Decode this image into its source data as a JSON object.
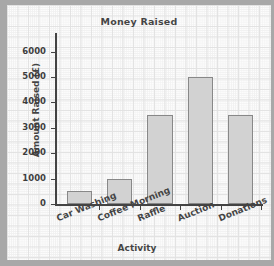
{
  "chart_data": {
    "type": "bar",
    "title": "Money Raised",
    "xlabel": "Activity",
    "ylabel": "Amount Raised (£)",
    "categories": [
      "Car Washing",
      "Coffee Morning",
      "Raffle",
      "Auction",
      "Donations"
    ],
    "values": [
      500,
      1000,
      3500,
      5000,
      3500
    ],
    "ylim": [
      0,
      6500
    ],
    "yticks": [
      0,
      1000,
      2000,
      3000,
      4000,
      5000,
      6000
    ],
    "ytick_labels": [
      "0",
      "1000",
      "2000",
      "3000",
      "4000",
      "5000",
      "6000"
    ],
    "grid": true,
    "legend": false,
    "bar_color": "#c9c9c9",
    "bar_edge_color": "#6e6e6e",
    "axis_color": "#1a1a1a",
    "background": "graph-paper"
  }
}
